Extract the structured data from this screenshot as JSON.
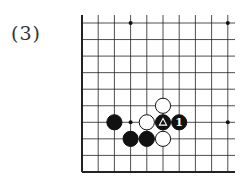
{
  "problem_label": "(3)",
  "board": {
    "origin_x": 82,
    "origin_y": 23,
    "spacing_x": 16.2,
    "spacing_y": 16.55,
    "cols": 10,
    "rows": 10,
    "edges": {
      "left": "solid",
      "bottom": "solid",
      "top": "open",
      "right": "open"
    },
    "star_points": [
      [
        3,
        0
      ],
      [
        9,
        0
      ],
      [
        3,
        6
      ],
      [
        9,
        6
      ]
    ],
    "stones": [
      {
        "color": "white",
        "col": 5,
        "row": 5,
        "mark": ""
      },
      {
        "color": "black",
        "col": 2,
        "row": 6,
        "mark": ""
      },
      {
        "color": "white",
        "col": 4,
        "row": 6,
        "mark": ""
      },
      {
        "color": "black",
        "col": 5,
        "row": 6,
        "mark": "triangle"
      },
      {
        "color": "black",
        "col": 6,
        "row": 6,
        "mark": "1"
      },
      {
        "color": "black",
        "col": 3,
        "row": 7,
        "mark": ""
      },
      {
        "color": "black",
        "col": 4,
        "row": 7,
        "mark": ""
      },
      {
        "color": "white",
        "col": 5,
        "row": 7,
        "mark": ""
      }
    ]
  }
}
